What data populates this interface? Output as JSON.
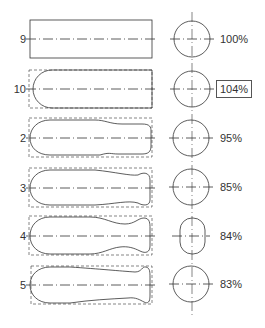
{
  "figure": {
    "rows": [
      {
        "id": "9",
        "label": "9",
        "percent": "100%",
        "boxed": false,
        "cy": 39,
        "section": "circle"
      },
      {
        "id": "10",
        "label": "10",
        "percent": "104%",
        "boxed": true,
        "cy": 89,
        "section": "circle"
      },
      {
        "id": "2",
        "label": "2",
        "percent": "95%",
        "boxed": false,
        "cy": 138,
        "section": "circle"
      },
      {
        "id": "3",
        "label": "3",
        "percent": "85%",
        "boxed": false,
        "cy": 188,
        "section": "circle"
      },
      {
        "id": "4",
        "label": "4",
        "percent": "84%",
        "boxed": false,
        "cy": 236,
        "section": "oval"
      },
      {
        "id": "5",
        "label": "5",
        "percent": "83%",
        "boxed": false,
        "cy": 285,
        "section": "circle"
      }
    ]
  },
  "colors": {
    "line": "#333333",
    "background": "#ffffff"
  }
}
